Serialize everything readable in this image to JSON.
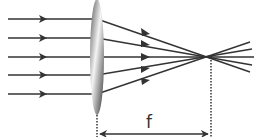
{
  "diagram": {
    "type": "converging-lens-ray-diagram",
    "focal_length_label": "f",
    "ray_count": 5,
    "colors": {
      "ray": "#333333",
      "lens_dark": "#333333",
      "lens_light": "#f2f2f2",
      "dotted": "#333333"
    }
  }
}
